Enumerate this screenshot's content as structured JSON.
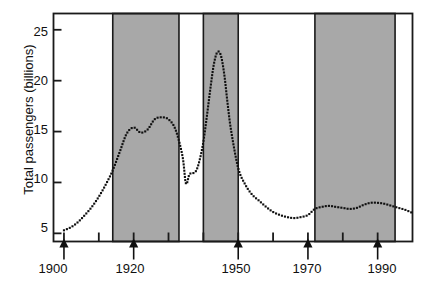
{
  "chart_data": {
    "type": "line",
    "title": "",
    "xlabel": "",
    "ylabel": "Total passengers (billions)",
    "xlim": [
      1897,
      2000
    ],
    "ylim": [
      4.2,
      26.6
    ],
    "grid": false,
    "legend": "none",
    "line_style": "dotted",
    "marker": "square-dot",
    "series_color": "#101010",
    "shade_color": "#a8a8a8",
    "axis_color": "#1a1a1a",
    "y_ticks": [
      5,
      10,
      15,
      20,
      25
    ],
    "y_tick_labels": [
      "5",
      "10",
      "15",
      "20",
      "25"
    ],
    "x_major_ticks": [
      1900,
      1920,
      1950,
      1970,
      1990
    ],
    "x_major_tick_labels": [
      "1900",
      "1920",
      "1950",
      "1970",
      "1990"
    ],
    "x_minor_ticks": [
      1910,
      1930,
      1940,
      1960,
      1980
    ],
    "shaded_bands": [
      {
        "start": 1914,
        "end": 1933
      },
      {
        "start": 1940,
        "end": 1950
      },
      {
        "start": 1972,
        "end": 1995
      }
    ],
    "x": [
      1900,
      1902,
      1904,
      1906,
      1908,
      1910,
      1912,
      1914,
      1916,
      1918,
      1920,
      1922,
      1924,
      1926,
      1928,
      1930,
      1932,
      1934,
      1935,
      1936,
      1937,
      1938,
      1939,
      1940,
      1941,
      1942,
      1943,
      1944,
      1945,
      1946,
      1947,
      1948,
      1950,
      1952,
      1954,
      1956,
      1958,
      1960,
      1962,
      1964,
      1966,
      1968,
      1970,
      1972,
      1974,
      1976,
      1978,
      1980,
      1982,
      1984,
      1986,
      1988,
      1990,
      1992,
      1994,
      1996,
      1998,
      2000
    ],
    "y": [
      5.3,
      5.6,
      6.1,
      6.8,
      7.6,
      8.6,
      9.8,
      11.2,
      13.0,
      14.8,
      15.4,
      14.9,
      15.2,
      16.2,
      16.4,
      16.2,
      15.2,
      12.6,
      9.9,
      10.8,
      10.9,
      11.2,
      12.3,
      14.0,
      16.5,
      19.2,
      21.6,
      22.8,
      22.5,
      20.6,
      17.6,
      15.0,
      11.4,
      9.8,
      8.8,
      8.2,
      7.6,
      7.1,
      6.8,
      6.6,
      6.5,
      6.6,
      6.8,
      7.4,
      7.6,
      7.7,
      7.6,
      7.5,
      7.4,
      7.5,
      7.8,
      8.0,
      8.0,
      7.9,
      7.7,
      7.5,
      7.3,
      7.0
    ]
  },
  "axes": {
    "y_axis_label": "Total passengers (billions)",
    "y_labels": [
      "25",
      "20",
      "15",
      "10",
      "5"
    ],
    "x_labels": [
      "1900",
      "1920",
      "1950",
      "1970",
      "1990"
    ]
  }
}
